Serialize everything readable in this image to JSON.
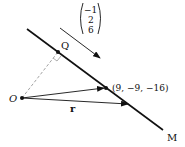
{
  "diagram": {
    "line_label": "M",
    "foot_label": "Q",
    "origin_label": "O",
    "point_label": "(9, −9, −16)",
    "position_vector_label": "r",
    "direction_vector": [
      "−1",
      "2",
      "6"
    ],
    "colors": {
      "stroke": "#111111",
      "dashed": "#999999"
    }
  }
}
